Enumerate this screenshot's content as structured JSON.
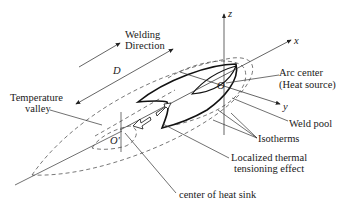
{
  "figure": {
    "labels": {
      "welding_direction_line1": "Welding",
      "welding_direction_line2": "Direction",
      "distance": "D",
      "temperature_valley_line1": "Temperature",
      "temperature_valley_line2": "valley",
      "axis_z": "z",
      "axis_x": "x",
      "axis_y": "y",
      "origin": "O",
      "origin_prime": "O'",
      "arc_center_line1": "Arc center",
      "arc_center_line2": "(Heat source)",
      "weld_pool": "Weld pool",
      "isotherms": "Isotherms",
      "thermal_line1": "Localized thermal",
      "thermal_line2": "tensioning effect",
      "heat_sink": "center of heat sink"
    }
  }
}
